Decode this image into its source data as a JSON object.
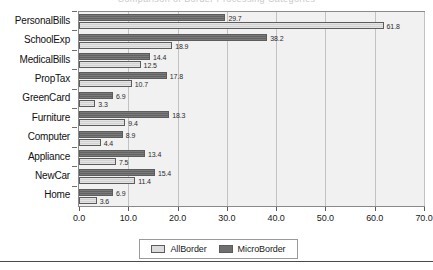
{
  "title_faint": "Comparison of Border Processing Categories",
  "chart_data": {
    "type": "bar",
    "orientation": "horizontal",
    "title": "",
    "xlabel": "",
    "ylabel": "",
    "xlim": [
      0.0,
      70.0
    ],
    "xticks": [
      "0.0",
      "10.0",
      "20.0",
      "30.0",
      "40.0",
      "50.0",
      "60.0",
      "70.0"
    ],
    "grid": true,
    "legend_position": "bottom",
    "categories": [
      "PersonalBills",
      "SchoolExp",
      "MedicalBills",
      "PropTax",
      "GreenCard",
      "Furniture",
      "Computer",
      "Appliance",
      "NewCar",
      "Home"
    ],
    "series": [
      {
        "name": "MicroBorder",
        "color": "#6f6f6f",
        "values": [
          29.7,
          38.2,
          14.4,
          17.8,
          6.9,
          18.3,
          8.9,
          13.4,
          15.4,
          6.9
        ],
        "labels": [
          "29.7",
          "38.2",
          "14.4",
          "17.8",
          "6.9",
          "18.3",
          "8.9",
          "13.4",
          "15.4",
          "6.9"
        ]
      },
      {
        "name": "AllBorder",
        "color": "#dcdcdc",
        "values": [
          61.8,
          18.9,
          12.5,
          10.7,
          3.3,
          9.4,
          4.4,
          7.5,
          11.4,
          3.6
        ],
        "labels": [
          "61.8",
          "18.9",
          "12.5",
          "10.7",
          "3.3",
          "9.4",
          "4.4",
          "7.5",
          "11.4",
          "3.6"
        ]
      }
    ]
  },
  "legend": {
    "items": [
      {
        "label": "AllBorder",
        "swatch": "all"
      },
      {
        "label": "MicroBorder",
        "swatch": "micro"
      }
    ]
  }
}
